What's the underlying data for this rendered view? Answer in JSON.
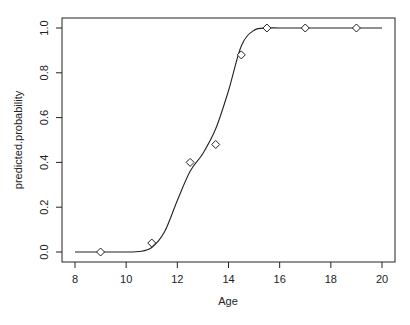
{
  "chart_data": {
    "type": "scatter",
    "title": "",
    "xlabel": "Age",
    "ylabel": "predicted.probability",
    "xlim": [
      8,
      20
    ],
    "ylim": [
      0,
      1
    ],
    "x_ticks": [
      "8",
      "10",
      "12",
      "14",
      "16",
      "18",
      "20"
    ],
    "y_ticks": [
      "0.0",
      "0.2",
      "0.4",
      "0.6",
      "0.8",
      "1.0"
    ],
    "grid": false,
    "legend": null,
    "series": [
      {
        "name": "observed",
        "marker": "diamond-open",
        "x": [
          9,
          11,
          12.5,
          13.5,
          14.5,
          15.5,
          17,
          19
        ],
        "y": [
          0.0,
          0.04,
          0.4,
          0.48,
          0.88,
          1.0,
          1.0,
          1.0
        ]
      },
      {
        "name": "fitted curve",
        "type": "line",
        "x": [
          8,
          9,
          10,
          10.5,
          11,
          11.5,
          12,
          12.5,
          13,
          13.5,
          14,
          14.5,
          15,
          15.5,
          16,
          17,
          18,
          19,
          20
        ],
        "y": [
          0.0,
          0.0,
          0.0,
          0.002,
          0.02,
          0.09,
          0.23,
          0.36,
          0.44,
          0.55,
          0.72,
          0.92,
          0.99,
          1.0,
          1.0,
          1.0,
          1.0,
          1.0,
          1.0
        ]
      }
    ]
  }
}
